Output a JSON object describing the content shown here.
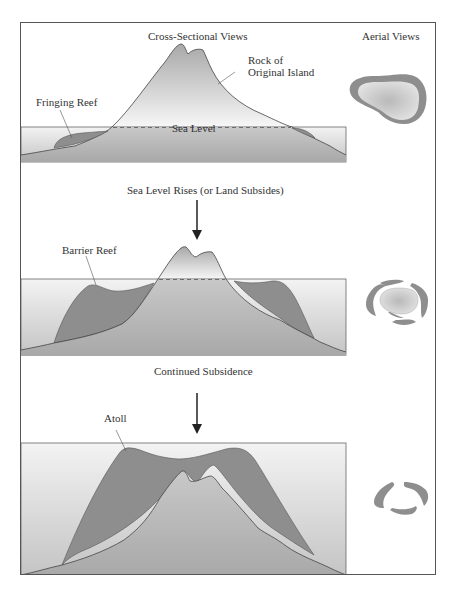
{
  "headers": {
    "cross_sectional": "Cross-Sectional Views",
    "aerial": "Aerial Views"
  },
  "panel1": {
    "rock_label_line1": "Rock of",
    "rock_label_line2": "Original Island",
    "reef_label": "Fringing Reef",
    "sea_level_label": "Sea Level"
  },
  "transition1": "Sea Level Rises (or Land Subsides)",
  "panel2": {
    "reef_label": "Barrier Reef"
  },
  "transition2": "Continued Subsidence",
  "panel3": {
    "reef_label": "Atoll"
  },
  "colors": {
    "water_top": "#f2f2f2",
    "water_bottom": "#c8c8c8",
    "reef": "#8e8e8e",
    "rock_light": "#f0f0f0",
    "rock_dark": "#b5b5b5",
    "outline": "#444444"
  }
}
